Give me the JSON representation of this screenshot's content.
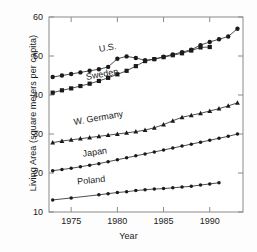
{
  "chart_data": {
    "type": "line",
    "title": "",
    "xlabel": "Year",
    "ylabel": "Living Area (square meters per capita)",
    "xlim": [
      1972.6,
      1993.6
    ],
    "ylim": [
      10,
      60
    ],
    "xticks": [
      1975,
      1980,
      1985,
      1990
    ],
    "xtick_labels": [
      "1975",
      "1980",
      "1985",
      "1990"
    ],
    "yticks": [
      10,
      20,
      30,
      40,
      50,
      60
    ],
    "ytick_labels": [
      "10",
      "20",
      "30",
      "40",
      "50",
      "60"
    ],
    "grid": false,
    "legend": "inline-annotations",
    "series": [
      {
        "name": "U.S.",
        "label": "U.S.",
        "marker": "filled-circle",
        "color": "#1a1a1a",
        "label_x": 1979.0,
        "label_y": 51.4,
        "label_rotation": -10,
        "x": [
          1973,
          1974,
          1975,
          1976,
          1977,
          1978,
          1979,
          1980,
          1981,
          1982,
          1983,
          1984,
          1985,
          1986,
          1987,
          1988,
          1989,
          1990,
          1991,
          1992,
          1993
        ],
        "y": [
          44.6,
          45.0,
          45.4,
          45.8,
          46.2,
          46.6,
          47.2,
          49.3,
          49.9,
          49.5,
          48.9,
          49.2,
          49.8,
          50.4,
          51.0,
          51.6,
          52.8,
          53.6,
          54.3,
          55.0,
          57.0
        ]
      },
      {
        "name": "Sweden",
        "label": "Sweden",
        "marker": "filled-square",
        "color": "#1a1a1a",
        "label_x": 1978.4,
        "label_y": 44.6,
        "label_rotation": -10,
        "x": [
          1973,
          1974,
          1975,
          1976,
          1977,
          1978,
          1979,
          1980,
          1981,
          1982,
          1983,
          1984,
          1985,
          1986,
          1987,
          1988,
          1989,
          1990
        ],
        "y": [
          40.6,
          41.2,
          41.7,
          42.3,
          42.9,
          43.6,
          44.4,
          45.3,
          46.2,
          47.4,
          48.7,
          49.2,
          49.7,
          50.2,
          50.7,
          51.4,
          52.2,
          52.3
        ]
      },
      {
        "name": "W. Germany",
        "label": "W. Germany",
        "marker": "filled-triangle",
        "color": "#1a1a1a",
        "label_x": 1978.0,
        "label_y": 33.4,
        "label_rotation": -10,
        "x": [
          1973,
          1974,
          1975,
          1976,
          1977,
          1978,
          1979,
          1980,
          1981,
          1982,
          1983,
          1984,
          1985,
          1986,
          1987,
          1988,
          1989,
          1990,
          1991,
          1992,
          1993
        ],
        "y": [
          27.8,
          28.2,
          28.5,
          28.8,
          29.1,
          29.4,
          29.7,
          30.0,
          30.3,
          30.6,
          31.0,
          31.6,
          32.4,
          33.4,
          34.3,
          34.8,
          35.3,
          35.9,
          36.5,
          37.2,
          38.0
        ]
      },
      {
        "name": "Japan",
        "label": "Japan",
        "marker": "filled-dot",
        "color": "#1a1a1a",
        "label_x": 1977.6,
        "label_y": 24.6,
        "label_rotation": -8,
        "x": [
          1973,
          1974,
          1975,
          1976,
          1977,
          1978,
          1979,
          1980,
          1981,
          1982,
          1983,
          1984,
          1985,
          1986,
          1987,
          1988,
          1989,
          1990,
          1991,
          1992,
          1993
        ],
        "y": [
          20.6,
          20.9,
          21.2,
          21.6,
          22.0,
          22.4,
          22.9,
          23.4,
          23.9,
          24.4,
          24.9,
          25.4,
          25.9,
          26.4,
          26.9,
          27.4,
          27.9,
          28.4,
          28.9,
          29.4,
          30.0
        ]
      },
      {
        "name": "Poland",
        "label": "Poland",
        "marker": "filled-dot",
        "color": "#1a1a1a",
        "label_x": 1977.2,
        "label_y": 17.4,
        "label_rotation": -6,
        "x": [
          1973,
          1975,
          1978,
          1979,
          1980,
          1981,
          1982,
          1983,
          1984,
          1985,
          1986,
          1987,
          1988,
          1989,
          1990,
          1991
        ],
        "y": [
          13.1,
          13.6,
          14.4,
          14.7,
          15.0,
          15.2,
          15.5,
          15.7,
          15.9,
          16.0,
          16.2,
          16.4,
          16.6,
          16.9,
          17.2,
          17.5
        ]
      }
    ]
  }
}
